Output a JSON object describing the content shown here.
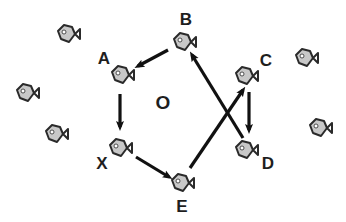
{
  "diagram": {
    "colors": {
      "fish_fill": "#c8c8c8",
      "fish_outline": "#2a2a2a",
      "fish_eye": "#ffffff",
      "arrow": "#111111",
      "label": "#1e1e1e",
      "background": "#ffffff"
    },
    "center_label": {
      "text": "O",
      "x": 163,
      "y": 102
    },
    "nodes": [
      {
        "id": "A",
        "label": "A",
        "fish_x": 122,
        "fish_y": 75,
        "label_x": 104,
        "label_y": 58
      },
      {
        "id": "B",
        "label": "B",
        "fish_x": 184,
        "fish_y": 42,
        "label_x": 186,
        "label_y": 19
      },
      {
        "id": "C",
        "label": "C",
        "fish_x": 246,
        "fish_y": 76,
        "label_x": 266,
        "label_y": 60
      },
      {
        "id": "D",
        "label": "D",
        "fish_x": 246,
        "fish_y": 150,
        "label_x": 268,
        "label_y": 163
      },
      {
        "id": "X",
        "label": "X",
        "fish_x": 120,
        "fish_y": 148,
        "label_x": 102,
        "label_y": 163
      },
      {
        "id": "E",
        "label": "E",
        "fish_x": 182,
        "fish_y": 183,
        "label_x": 182,
        "label_y": 206
      }
    ],
    "background_fish": [
      {
        "x": 68,
        "y": 34
      },
      {
        "x": 27,
        "y": 93
      },
      {
        "x": 56,
        "y": 134
      },
      {
        "x": 306,
        "y": 58
      },
      {
        "x": 320,
        "y": 128
      }
    ],
    "edges": [
      {
        "from": "B",
        "to": "A",
        "x1": 168,
        "y1": 50,
        "x2": 138,
        "y2": 66
      },
      {
        "from": "A",
        "to": "X",
        "x1": 120,
        "y1": 94,
        "x2": 120,
        "y2": 127
      },
      {
        "from": "X",
        "to": "E",
        "x1": 136,
        "y1": 157,
        "x2": 169,
        "y2": 177
      },
      {
        "from": "E",
        "to": "C",
        "x1": 190,
        "y1": 168,
        "x2": 243,
        "y2": 90
      },
      {
        "from": "D",
        "to": "B",
        "x1": 243,
        "y1": 138,
        "x2": 192,
        "y2": 55
      },
      {
        "from": "C",
        "to": "D",
        "x1": 249,
        "y1": 92,
        "x2": 249,
        "y2": 130
      }
    ]
  }
}
